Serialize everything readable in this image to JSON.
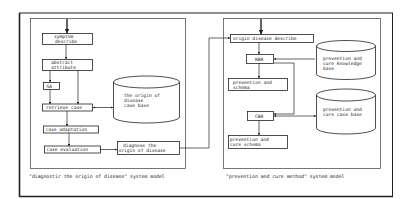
{
  "colors": {
    "background": "#ffffff",
    "stroke": "#222222",
    "panel_stroke": "#555555",
    "text": "#222222"
  },
  "left_panel": {
    "caption": "\"diagnostic the origin of disease\" system model",
    "nodes": {
      "symptom": [
        "symptom",
        "describe"
      ],
      "abstract": [
        "abstract",
        "attribute"
      ],
      "ga": "GA",
      "retrieve": "retrieve case",
      "adaptation": "case adaptation",
      "evaluation": "case evaluation",
      "diagnose": [
        "diagnose the",
        "origin of disease"
      ]
    },
    "database": [
      "the origin of",
      "disease",
      "case base"
    ]
  },
  "right_panel": {
    "caption": "\"prevention and cure method\" system model",
    "nodes": {
      "origin": "origin disease describe",
      "rbr": "RBR",
      "schema": [
        "prevention and",
        "schema"
      ],
      "cbr": "CBR",
      "cure_schema": [
        "prevention and",
        "cure schema"
      ]
    },
    "knowledge_base": [
      "prevention and",
      "cure knowledge",
      "base"
    ],
    "case_base": [
      "prevention and",
      "cure case base"
    ]
  }
}
